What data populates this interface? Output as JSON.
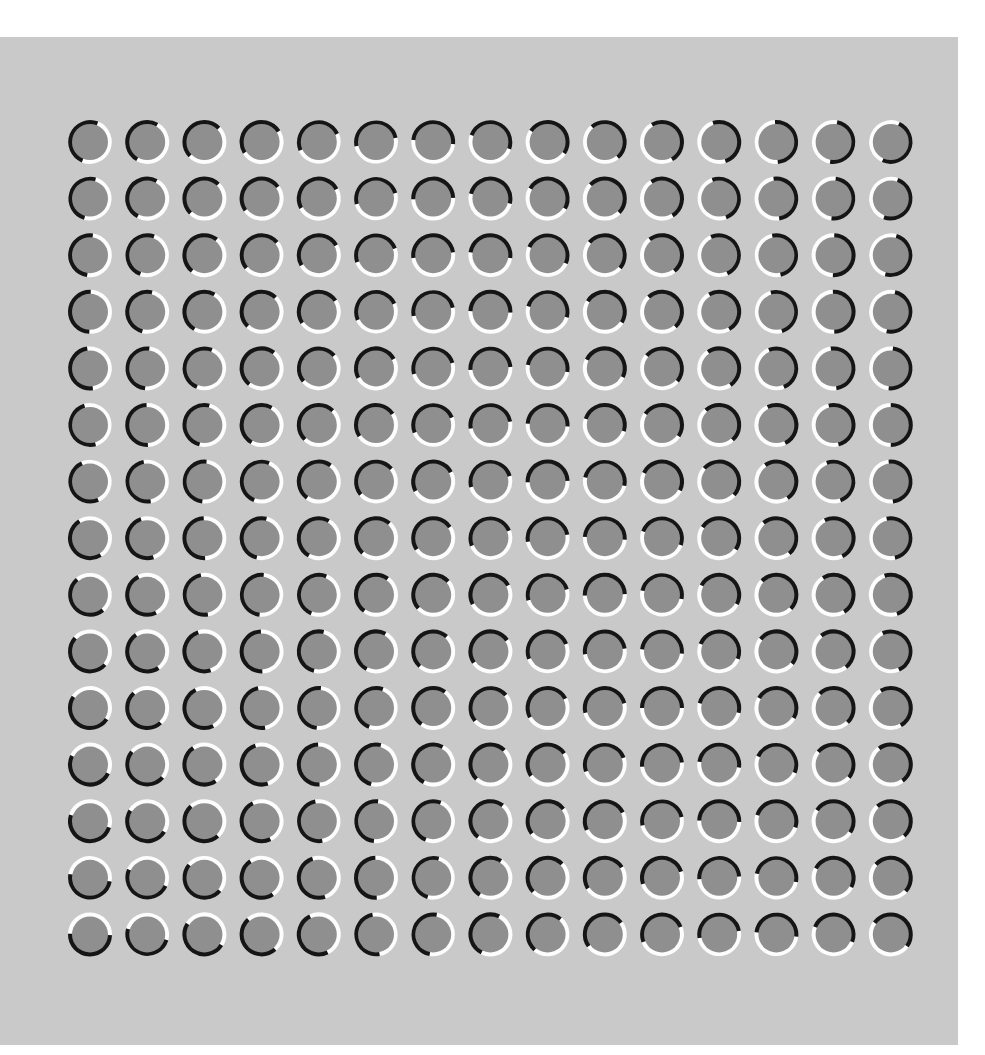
{
  "figure": {
    "type": "illusion-stimulus",
    "canvas_width": 985,
    "canvas_height": 1055,
    "outer_background_color": "#ffffff",
    "panel": {
      "x": 0,
      "y": 37,
      "width": 958,
      "height": 1008,
      "color": "#c9c9c9"
    }
  },
  "grid": {
    "rows": 15,
    "cols": 15,
    "origin_x": 90,
    "origin_y": 142,
    "spacing_x": 57.2,
    "spacing_y": 56.6,
    "disc_radius": 18,
    "ring_outer_radius": 22,
    "ring_inner_radius": 17,
    "disc_color": "#8f8f8f",
    "arc_light_color": "#fdfdfd",
    "arc_dark_color": "#151515",
    "arc_span_degrees": 180
  },
  "chart_data": {
    "type": "heatmap",
    "xlabel": "column index",
    "ylabel": "row index",
    "categories": [
      "c1",
      "c2",
      "c3",
      "c4",
      "c5",
      "c6",
      "c7",
      "c8",
      "c9",
      "c10",
      "c11",
      "c12",
      "c13",
      "c14",
      "c15"
    ],
    "row_labels": [
      "r1",
      "r2",
      "r3",
      "r4",
      "r5",
      "r6",
      "r7",
      "r8",
      "r9",
      "r10",
      "r11",
      "r12",
      "r13",
      "r14",
      "r15"
    ],
    "values": [
      [
        22,
        30,
        46,
        58,
        66,
        78,
        96,
        110,
        124,
        140,
        150,
        162,
        176,
        190,
        204
      ],
      [
        16,
        28,
        44,
        54,
        62,
        74,
        88,
        104,
        120,
        134,
        148,
        160,
        172,
        186,
        200
      ],
      [
        8,
        20,
        38,
        50,
        60,
        70,
        82,
        98,
        114,
        130,
        142,
        156,
        168,
        182,
        196
      ],
      [
        2,
        14,
        30,
        44,
        56,
        66,
        78,
        92,
        106,
        122,
        138,
        150,
        164,
        178,
        192
      ],
      [
        352,
        6,
        22,
        38,
        50,
        62,
        74,
        86,
        100,
        116,
        130,
        146,
        158,
        172,
        186
      ],
      [
        344,
        358,
        14,
        30,
        44,
        56,
        68,
        80,
        94,
        108,
        124,
        138,
        154,
        166,
        180
      ],
      [
        336,
        350,
        6,
        22,
        36,
        50,
        62,
        74,
        88,
        102,
        116,
        132,
        146,
        160,
        174
      ],
      [
        328,
        342,
        358,
        14,
        30,
        42,
        56,
        68,
        80,
        94,
        110,
        124,
        140,
        154,
        168
      ],
      [
        320,
        334,
        350,
        6,
        22,
        36,
        48,
        62,
        74,
        88,
        102,
        118,
        134,
        148,
        162
      ],
      [
        312,
        326,
        342,
        358,
        14,
        28,
        42,
        56,
        68,
        82,
        96,
        112,
        128,
        142,
        156
      ],
      [
        304,
        318,
        334,
        350,
        6,
        20,
        36,
        50,
        62,
        76,
        90,
        104,
        120,
        136,
        150
      ],
      [
        296,
        310,
        326,
        342,
        358,
        14,
        28,
        44,
        56,
        70,
        84,
        98,
        114,
        130,
        144
      ],
      [
        288,
        302,
        318,
        334,
        350,
        6,
        22,
        38,
        52,
        64,
        78,
        92,
        108,
        124,
        138
      ],
      [
        280,
        294,
        310,
        326,
        342,
        358,
        16,
        32,
        46,
        58,
        72,
        86,
        102,
        118,
        132
      ],
      [
        272,
        286,
        302,
        318,
        334,
        350,
        10,
        26,
        40,
        54,
        68,
        80,
        96,
        112,
        126
      ]
    ],
    "value_min": 2,
    "value_max": 358,
    "grid": false,
    "legend": "none"
  },
  "labels": {
    "stage_name": "illusion-canvas",
    "panel_name": "stimulus-panel",
    "cell_name": "ring-cell"
  }
}
